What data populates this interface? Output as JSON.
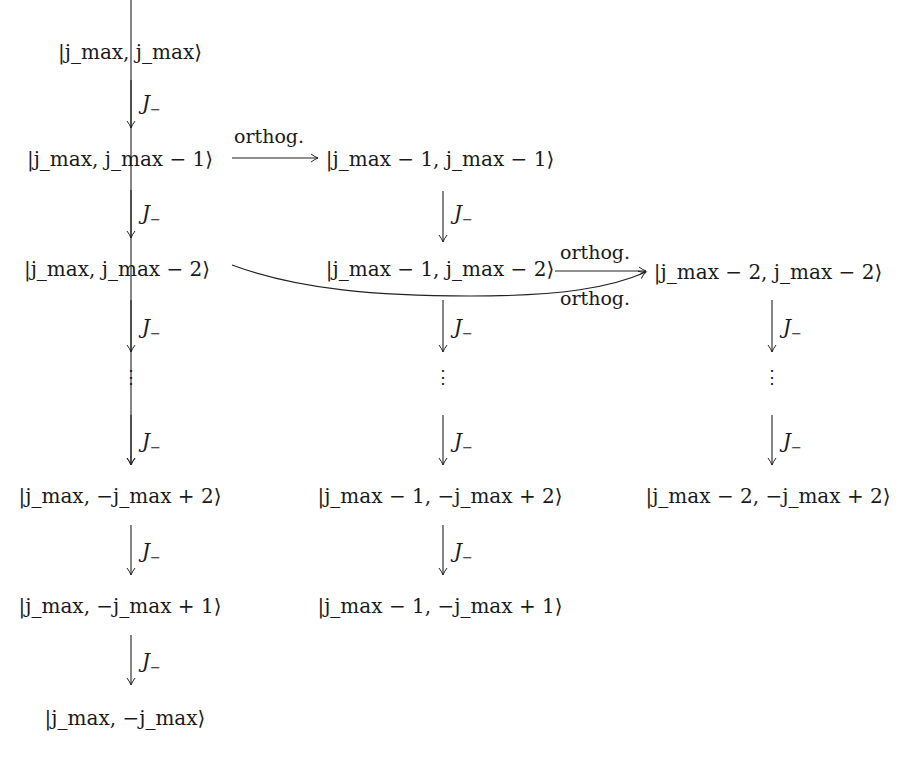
{
  "diagram": {
    "operator_label": "J",
    "operator_sub": "−",
    "orthog_label": "orthog.",
    "columns": [
      {
        "states": [
          {
            "j": "j_max",
            "m": "j_max",
            "text": "|j_max, j_max⟩"
          },
          {
            "j": "j_max",
            "m": "j_max − 1",
            "text": "|j_max, j_max − 1⟩"
          },
          {
            "j": "j_max",
            "m": "j_max − 2",
            "text": "|j_max, j_max − 2⟩"
          },
          {
            "j": "j_max",
            "m": "−j_max + 2",
            "text": "|j_max, −j_max + 2⟩"
          },
          {
            "j": "j_max",
            "m": "−j_max + 1",
            "text": "|j_max, −j_max + 1⟩"
          },
          {
            "j": "j_max",
            "m": "−j_max",
            "text": "|j_max, −j_max⟩"
          }
        ]
      },
      {
        "states": [
          {
            "j": "j_max − 1",
            "m": "j_max − 1",
            "text": "|j_max − 1, j_max − 1⟩"
          },
          {
            "j": "j_max − 1",
            "m": "j_max − 2",
            "text": "|j_max − 1, j_max − 2⟩"
          },
          {
            "j": "j_max − 1",
            "m": "−j_max + 2",
            "text": "|j_max − 1, −j_max + 2⟩"
          },
          {
            "j": "j_max − 1",
            "m": "−j_max + 1",
            "text": "|j_max − 1, −j_max + 1⟩"
          }
        ]
      },
      {
        "states": [
          {
            "j": "j_max − 2",
            "m": "j_max − 2",
            "text": "|j_max − 2, j_max − 2⟩"
          },
          {
            "j": "j_max − 2",
            "m": "−j_max + 2",
            "text": "|j_max − 2, −j_max + 2⟩"
          }
        ]
      }
    ],
    "edges": [
      {
        "from": "|j_max, j_max − 1⟩",
        "to": "|j_max − 1, j_max − 1⟩",
        "label": "orthog."
      },
      {
        "from": "|j_max − 1, j_max − 2⟩",
        "to": "|j_max − 2, j_max − 2⟩",
        "label": "orthog."
      },
      {
        "from": "|j_max, j_max − 2⟩",
        "to": "|j_max − 2, j_max − 2⟩",
        "label": "orthog."
      }
    ],
    "ellipsis": "⋮"
  }
}
